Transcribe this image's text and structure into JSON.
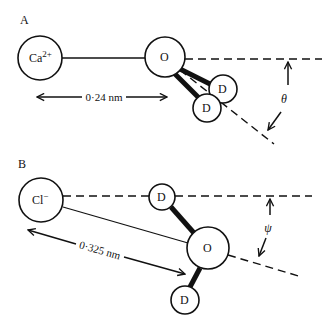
{
  "panels": {
    "A": {
      "label": "A",
      "ion": {
        "symbol": "Ca",
        "charge": "2+"
      },
      "oxygen": "O",
      "deuterium_1": "D",
      "deuterium_2": "D",
      "distance_label": "0·24 nm",
      "angle_label": "θ"
    },
    "B": {
      "label": "B",
      "ion": {
        "symbol": "Cl",
        "charge": "−"
      },
      "oxygen": "O",
      "deuterium_1": "D",
      "deuterium_2": "D",
      "distance_label": "0·325 nm",
      "angle_label": "ψ"
    }
  }
}
